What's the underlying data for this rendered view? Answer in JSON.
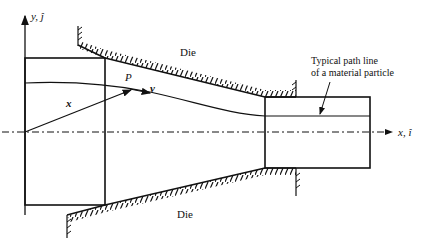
{
  "diagram": {
    "type": "extrusion-die-schematic",
    "labels": {
      "y_axis": "y, ĵ",
      "x_axis": "x, î",
      "die_top": "Die",
      "die_bottom": "Die",
      "point": "P",
      "position_vector": "x",
      "velocity_vector": "v",
      "annotation_line1": "Typical path line",
      "annotation_line2": "of a material particle"
    },
    "colors": {
      "stroke": "#111111",
      "background": "#ffffff"
    }
  }
}
